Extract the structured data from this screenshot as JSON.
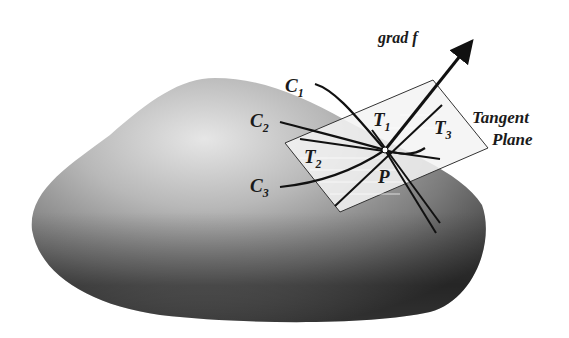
{
  "figure": {
    "gradient_label": "grad f",
    "plane_label_line1": "Tangent",
    "plane_label_line2": "Plane",
    "point_label": "P",
    "curves": [
      {
        "name": "C",
        "sub": "1"
      },
      {
        "name": "C",
        "sub": "2"
      },
      {
        "name": "C",
        "sub": "3"
      }
    ],
    "tangents": [
      {
        "name": "T",
        "sub": "1"
      },
      {
        "name": "T",
        "sub": "2"
      },
      {
        "name": "T",
        "sub": "3"
      }
    ]
  },
  "colors": {
    "background": "#ffffff",
    "surface_light": "#d9d9d9",
    "surface_dark": "#3a3a3a",
    "line": "#111111",
    "plane_fill": "#f2f2f2"
  }
}
